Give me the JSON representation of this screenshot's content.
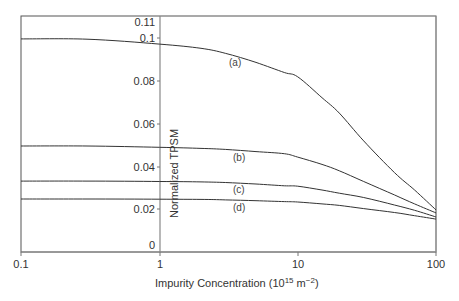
{
  "chart_data": {
    "type": "line",
    "title": "",
    "xlabel": "Impurity Concentration (10^15 m^-2)",
    "xlabel_parts": {
      "base": "Impurity Concentration (10",
      "sup1": "15",
      "mid": " m",
      "sup2": "−2",
      "end": ")"
    },
    "ylabel": "Normalized TPSM",
    "xscale": "log",
    "xlim": [
      0.1,
      100
    ],
    "ylim": [
      0,
      0.11
    ],
    "grid": false,
    "legend": "inline curve labels",
    "x_ticks": [
      "0.1",
      "1",
      "10",
      "100"
    ],
    "y_ticks": [
      "0",
      "0.02",
      "0.04",
      "0.06",
      "0.08",
      "0.1",
      "0.11"
    ],
    "x": [
      0.1,
      0.3,
      1,
      2,
      3,
      5,
      8,
      10,
      15,
      20,
      30,
      50,
      70,
      100
    ],
    "series": [
      {
        "name": "(a)",
        "values": [
          0.0997,
          0.0996,
          0.0973,
          0.0953,
          0.093,
          0.0887,
          0.084,
          0.082,
          0.0722,
          0.065,
          0.052,
          0.0372,
          0.029,
          0.0197
        ]
      },
      {
        "name": "(b)",
        "values": [
          0.0496,
          0.0496,
          0.049,
          0.0485,
          0.048,
          0.047,
          0.046,
          0.0444,
          0.041,
          0.038,
          0.033,
          0.0267,
          0.0225,
          0.0183
        ]
      },
      {
        "name": "(c)",
        "values": [
          0.0332,
          0.0332,
          0.033,
          0.0328,
          0.0325,
          0.0318,
          0.031,
          0.0308,
          0.029,
          0.0275,
          0.0255,
          0.022,
          0.0195,
          0.0164
        ]
      },
      {
        "name": "(d)",
        "values": [
          0.0248,
          0.0248,
          0.0247,
          0.0246,
          0.0244,
          0.024,
          0.0236,
          0.0234,
          0.0225,
          0.0218,
          0.0203,
          0.0185,
          0.017,
          0.0154
        ]
      }
    ],
    "annotations": [
      "(a)",
      "(b)",
      "(c)",
      "(d)"
    ]
  },
  "axes": {
    "x_tick_labels": [
      "0.1",
      "1",
      "10",
      "100"
    ],
    "y_tick_labels": [
      "0",
      "0.02",
      "0.04",
      "0.06",
      "0.08",
      "0.1",
      "0.11"
    ],
    "ylabel": "Normalized TPSM"
  },
  "labels": {
    "a": "(a)",
    "b": "(b)",
    "c": "(c)",
    "d": "(d)"
  }
}
